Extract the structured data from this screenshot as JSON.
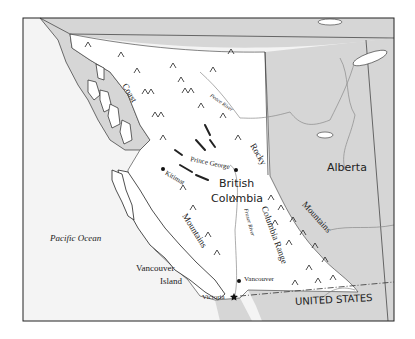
{
  "map": {
    "title": "British Columbia physical map",
    "colors": {
      "background": "#ffffff",
      "ocean": "#f4f4f4",
      "foreign_land": "#d6d6d6",
      "province": "#ffffff",
      "border": "#333333",
      "river": "#8a8a8a"
    },
    "labels": {
      "province": [
        "British",
        "Columbia"
      ],
      "neighbor_province": "Alberta",
      "country": "UNITED STATES",
      "ocean": "Pacific Ocean",
      "island": [
        "Vancouver",
        "Island"
      ],
      "ranges": {
        "coast": "Coast",
        "coast_mountains": "Mountains",
        "rocky": "Rocky",
        "rocky_mountains": "Mountains",
        "columbia": "Columbia Range"
      },
      "rivers": {
        "peace": "Peace River",
        "fraser": "Fraser River"
      },
      "cities": {
        "prince_george": "Prince George",
        "kitimat": "Kitimat",
        "vancouver": "Vancouver",
        "victoria": "Victoria"
      }
    },
    "symbols": {
      "city": "dot",
      "capital": "star",
      "mountain": "peak"
    }
  }
}
